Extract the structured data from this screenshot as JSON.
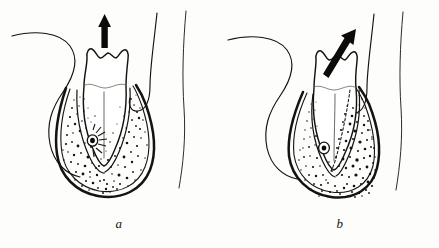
{
  "figure": {
    "title": "Tooth movement diagrams",
    "background_color": "#fdfdfb",
    "ink_color": "#16130f",
    "style": "line drawing",
    "panel_count": 2
  },
  "panels": [
    {
      "id": "a",
      "caption": "a",
      "label_position": "bottom-center",
      "movement": "vertical extrusion",
      "arrow": {
        "name": "vertical-up-arrow",
        "direction": "up",
        "angle_degrees": 0,
        "color": "#0d0b08",
        "position": "above crown"
      },
      "tooth": {
        "name": "molar-tooth",
        "crown_cusps": 2,
        "cervical_line": true,
        "root_count": 1,
        "root_orientation": "vertical"
      },
      "bone": {
        "name": "alveolar-bone",
        "stipple_pattern": "symmetric",
        "stipple_density": "uniform",
        "socket_outline": "double"
      },
      "vessel": {
        "name": "neurovascular-bundle",
        "radiating_rays": 7,
        "side": "left"
      },
      "soft_tissue_curves": 3,
      "dashed_original_position": false
    },
    {
      "id": "b",
      "caption": "b",
      "label_position": "bottom-center",
      "movement": "tipping / tilting",
      "arrow": {
        "name": "diagonal-up-right-arrow",
        "direction": "up-right",
        "angle_degrees": 35,
        "color": "#0d0b08",
        "position": "through crown"
      },
      "tooth": {
        "name": "molar-tooth",
        "crown_cusps": 2,
        "cervical_line": true,
        "root_count": 1,
        "root_orientation": "tipped-left"
      },
      "bone": {
        "name": "alveolar-bone",
        "stipple_pattern": "asymmetric",
        "stipple_density": "denser on right (pressure side)",
        "socket_outline": "double"
      },
      "vessel": {
        "name": "neurovascular-bundle",
        "radiating_rays": 0,
        "side": "left"
      },
      "soft_tissue_curves": 3,
      "dashed_original_position": true
    }
  ]
}
